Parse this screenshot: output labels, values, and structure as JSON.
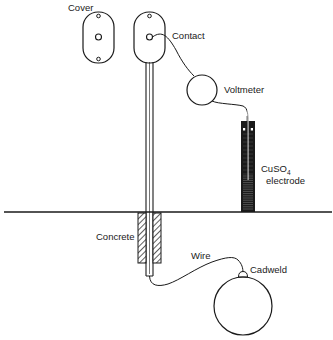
{
  "diagram": {
    "labels": {
      "cover": "Cover",
      "contact": "Contact",
      "voltmeter": "Voltmeter",
      "electrode_main": "CuSO",
      "electrode_sub": "4",
      "electrode_second": "electrode",
      "concrete": "Concrete",
      "wire": "Wire",
      "cadweld": "Cadweld"
    },
    "colors": {
      "ink": "#1a1a1a",
      "background": "#ffffff"
    }
  }
}
